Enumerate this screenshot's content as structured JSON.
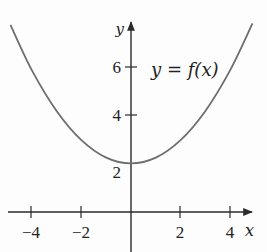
{
  "chart_data": {
    "type": "line",
    "title": "",
    "annotation": "y = f(x)",
    "xlabel": "x",
    "ylabel": "y",
    "xlim": [
      -5.3,
      4.8
    ],
    "ylim": [
      -1.6,
      7.9
    ],
    "grid": false,
    "legend": null,
    "x_ticks": [
      -4,
      -2,
      2,
      4
    ],
    "x_tick_labels": [
      "−4",
      "−2",
      "2",
      "4"
    ],
    "y_ticks": [
      2,
      4,
      6
    ],
    "y_tick_labels": [
      "2",
      "4",
      "6"
    ],
    "series": [
      {
        "name": "y = f(x)",
        "description": "upward-opening parabola with minimum at (0, 2)",
        "x": [
          -4.86,
          -4,
          -3,
          -2,
          -1,
          0,
          1,
          2,
          3,
          4,
          4.9
        ],
        "y": [
          7.7,
          5.84,
          4.16,
          2.96,
          2.24,
          2.0,
          2.24,
          2.96,
          4.16,
          5.84,
          7.76
        ]
      }
    ]
  },
  "labels": {
    "y_axis": "y",
    "x_axis": "x",
    "curve": "y = f(x)",
    "ticks_x": [
      "−4",
      "−2",
      "2",
      "4"
    ],
    "ticks_y": [
      "6",
      "4",
      "2"
    ]
  },
  "colors": {
    "axis": "#2a2a2a",
    "curve": "#6e6e6e",
    "text": "#222222"
  }
}
